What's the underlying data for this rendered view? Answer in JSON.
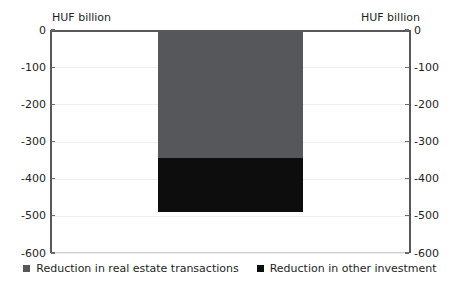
{
  "chart_data": {
    "type": "bar",
    "title": "",
    "subtitle": "",
    "xlabel": "",
    "ylabel": "HUF billion",
    "unit_caption_left": "HUF billion",
    "unit_caption_right": "HUF billion",
    "categories": [
      ""
    ],
    "stacked": true,
    "series": [
      {
        "name": "Reduction in real estate transactions",
        "color": "#56575a",
        "values": [
          -344
        ]
      },
      {
        "name": "Reduction in other investment",
        "color": "#0d0d0d",
        "values": [
          -145
        ]
      }
    ],
    "total_values": [
      -489
    ],
    "ylim": [
      -600,
      0
    ],
    "y_ticks": [
      0,
      -100,
      -200,
      -300,
      -400,
      -500,
      -600
    ],
    "y_tick_labels": [
      "0",
      "-100",
      "-200",
      "-300",
      "-400",
      "-500",
      "-600"
    ],
    "y_tick_labels_right": [
      "0",
      "-100",
      "-200",
      "-300",
      "-400",
      "-500",
      "-600"
    ],
    "grid": true,
    "grid_axis": "y",
    "legend_position": "bottom",
    "legend": [
      "Reduction in real estate transactions",
      "Reduction in other investment"
    ],
    "annotations": [],
    "colors": {
      "series_real_estate": "#56575a",
      "series_other_investment": "#0d0d0d",
      "axis": "#58585a",
      "grid": "#efeff1",
      "text": "#231f20",
      "background": "#ffffff"
    }
  }
}
